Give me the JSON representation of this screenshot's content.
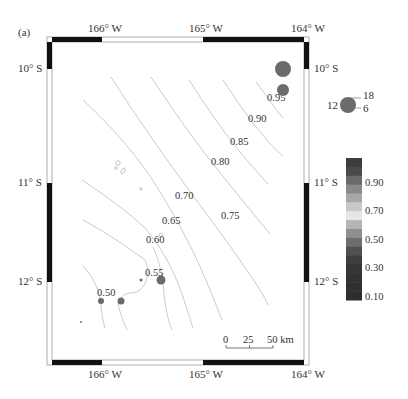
{
  "panel_label": "(a)",
  "axes": {
    "x_ticks": [
      {
        "label": "166° W",
        "x": 102
      },
      {
        "label": "165° W",
        "x": 203
      },
      {
        "label": "164° W",
        "x": 305
      }
    ],
    "y_ticks": [
      {
        "label": "10° S",
        "y": 69
      },
      {
        "label": "11° S",
        "y": 183
      },
      {
        "label": "12° S",
        "y": 282
      }
    ]
  },
  "contours": [
    {
      "label": "0.95",
      "x": 267,
      "y": 101
    },
    {
      "label": "0.90",
      "x": 248,
      "y": 122
    },
    {
      "label": "0.85",
      "x": 230,
      "y": 145
    },
    {
      "label": "0.80",
      "x": 211,
      "y": 165
    },
    {
      "label": "0.75",
      "x": 221,
      "y": 219
    },
    {
      "label": "0.70",
      "x": 175,
      "y": 199
    },
    {
      "label": "0.65",
      "x": 162,
      "y": 224
    },
    {
      "label": "0.60",
      "x": 146,
      "y": 243
    },
    {
      "label": "0.55",
      "x": 145,
      "y": 276
    },
    {
      "label": "0.50",
      "x": 97,
      "y": 296
    }
  ],
  "events": [
    {
      "x": 283,
      "y": 69,
      "r": 8
    },
    {
      "x": 283,
      "y": 90,
      "r": 6
    },
    {
      "x": 161,
      "y": 280,
      "r": 4.5
    },
    {
      "x": 141,
      "y": 280,
      "r": 1.5
    },
    {
      "x": 121,
      "y": 301,
      "r": 3.5
    },
    {
      "x": 101,
      "y": 301,
      "r": 3
    },
    {
      "x": 81,
      "y": 322,
      "r": 1
    }
  ],
  "size_legend": {
    "labels": [
      "12",
      "18",
      "6"
    ],
    "circle": {
      "x": 348,
      "y": 105,
      "r": 8
    }
  },
  "colorbar": {
    "ticks": [
      "0.90",
      "0.70",
      "0.50",
      "0.30",
      "0.10"
    ],
    "colors": [
      "#3d3d3d",
      "#4a4a4a",
      "#6a6a6a",
      "#8a8a8a",
      "#a8a8a8",
      "#c8c8c8",
      "#e6e6e6",
      "#b5b5b5",
      "#8f8f8f",
      "#6e6e6e",
      "#505050",
      "#3e3e3e",
      "#363636",
      "#333333",
      "#303030",
      "#2e2e2e"
    ]
  },
  "scale_bar": {
    "labels": [
      "0",
      "25",
      "50 km"
    ]
  },
  "colors": {
    "event_fill": "#6b6b6b",
    "frame_black": "#111111",
    "contour_stroke": "#c4c4c4"
  }
}
